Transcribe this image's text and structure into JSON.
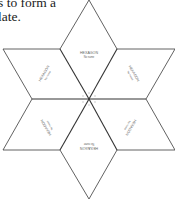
{
  "text": {
    "line1": "s to form a",
    "line2": "late."
  },
  "diagram": {
    "type": "six-pointed-star-template",
    "pieces": [
      {
        "position": "top",
        "title": "HEXAGON",
        "subtitle": "No name"
      },
      {
        "position": "upper-right",
        "title": "HEXAGON",
        "subtitle": "No name"
      },
      {
        "position": "lower-right",
        "title": "HEXAGON",
        "subtitle": "No name"
      },
      {
        "position": "bottom",
        "title": "HEXAGON",
        "subtitle": "No name"
      },
      {
        "position": "lower-left",
        "title": "HEXAGON",
        "subtitle": "No name"
      },
      {
        "position": "upper-left",
        "title": "HEXAGON",
        "subtitle": "No name"
      }
    ],
    "line_color": "#333333"
  }
}
